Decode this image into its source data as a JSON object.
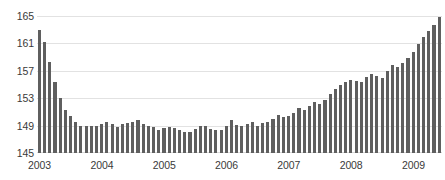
{
  "chart_data": {
    "type": "bar",
    "title": "",
    "subtitle": "",
    "xlabel": "",
    "ylabel": "",
    "ylim": [
      145,
      165
    ],
    "yticks": [
      145,
      149,
      153,
      157,
      161,
      165
    ],
    "xticks": [
      "2003",
      "2004",
      "2005",
      "2006",
      "2007",
      "2008",
      "2009"
    ],
    "grid": true,
    "legend": false,
    "bar_color": "#5f5f5f",
    "gridline_color": "#e2e2e2",
    "axis_text_color": "#3a3a3a",
    "background_color": "#ffffff",
    "x_start_year": 2003,
    "x_frequency": "monthly",
    "categories": [
      "2003-01",
      "2003-02",
      "2003-03",
      "2003-04",
      "2003-05",
      "2003-06",
      "2003-07",
      "2003-08",
      "2003-09",
      "2003-10",
      "2003-11",
      "2003-12",
      "2004-01",
      "2004-02",
      "2004-03",
      "2004-04",
      "2004-05",
      "2004-06",
      "2004-07",
      "2004-08",
      "2004-09",
      "2004-10",
      "2004-11",
      "2004-12",
      "2005-01",
      "2005-02",
      "2005-03",
      "2005-04",
      "2005-05",
      "2005-06",
      "2005-07",
      "2005-08",
      "2005-09",
      "2005-10",
      "2005-11",
      "2005-12",
      "2006-01",
      "2006-02",
      "2006-03",
      "2006-04",
      "2006-05",
      "2006-06",
      "2006-07",
      "2006-08",
      "2006-09",
      "2006-10",
      "2006-11",
      "2006-12",
      "2007-01",
      "2007-02",
      "2007-03",
      "2007-04",
      "2007-05",
      "2007-06",
      "2007-07",
      "2007-08",
      "2007-09",
      "2007-10",
      "2007-11",
      "2007-12",
      "2008-01",
      "2008-02",
      "2008-03",
      "2008-04",
      "2008-05",
      "2008-06",
      "2008-07",
      "2008-08",
      "2008-09",
      "2008-10",
      "2008-11",
      "2008-12",
      "2009-01",
      "2009-02",
      "2009-03",
      "2009-04",
      "2009-05",
      "2009-06"
    ],
    "values": [
      163.0,
      161.2,
      158.3,
      155.4,
      153.1,
      151.3,
      150.4,
      149.6,
      148.9,
      148.9,
      148.9,
      148.9,
      149.2,
      149.6,
      149.3,
      148.8,
      149.3,
      149.4,
      149.6,
      149.8,
      149.3,
      148.9,
      148.8,
      148.4,
      148.6,
      148.8,
      148.6,
      148.3,
      148.0,
      148.1,
      148.5,
      148.9,
      149.0,
      148.5,
      148.3,
      148.3,
      149.0,
      149.8,
      149.1,
      148.9,
      149.3,
      149.6,
      149.0,
      149.4,
      149.5,
      149.9,
      150.5,
      150.2,
      150.4,
      150.9,
      151.5,
      151.3,
      151.8,
      152.4,
      152.1,
      152.8,
      153.6,
      154.3,
      155.0,
      155.3,
      155.6,
      155.5,
      155.4,
      156.1,
      156.6,
      156.3,
      156.0,
      157.0,
      157.8,
      157.5,
      158.2,
      158.9,
      159.8,
      160.9,
      161.9,
      162.8,
      163.7,
      164.8
    ]
  }
}
